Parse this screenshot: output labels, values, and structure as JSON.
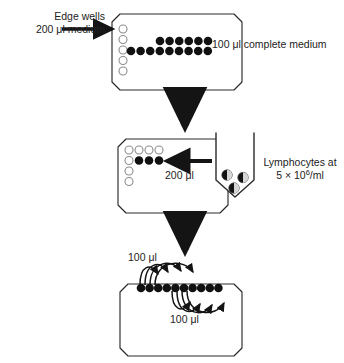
{
  "figure": {
    "background": "#ffffff",
    "ink": "#1a1a1a"
  },
  "labels": {
    "edge_wells_line1": "Edge wells",
    "edge_wells_line2": "200 μl medium",
    "complete_medium": "100 μl complete medium",
    "two_hundred_ul": "200 μl",
    "lymphocytes_line1": "Lymphocytes at",
    "lymphocytes_line2_prefix": "5 × 10",
    "lymphocytes_line2_sup": "6",
    "lymphocytes_line2_suffix": "/ml",
    "hundred_ul_top": "100 μl",
    "hundred_ul_bottom": "100 μl"
  },
  "colors": {
    "outline": "#2a2a2a",
    "filled_well": "#111111",
    "open_well_stroke": "#8d8d8d",
    "open_well_fill": "#ffffff",
    "arrow": "#141414"
  },
  "steps": [
    {
      "id": "step-1",
      "name": "plate-dispense-medium",
      "plate": {
        "x": 112,
        "y": 14,
        "width": 130,
        "height": 76
      },
      "open_wells": {
        "count": 5,
        "start_x": 122,
        "start_y": 29,
        "dy": 10.5,
        "r": 4.0
      },
      "filled_rows": [
        {
          "count": 6,
          "start_x": 158,
          "y": 41,
          "dx": 9.6,
          "r": 4.2
        },
        {
          "count": 11,
          "start_x": 129,
          "y": 51,
          "dx": 9.6,
          "r": 4.2
        }
      ],
      "in_arrow": {
        "x1": 62,
        "y1": 29,
        "x2": 118,
        "y2": 29
      }
    },
    {
      "id": "step-2",
      "name": "plate-add-lymphocytes",
      "plate": {
        "x": 118,
        "y": 139,
        "width": 110,
        "height": 74
      },
      "open_wells_column": {
        "count": 5,
        "start_x": 128,
        "start_y": 150,
        "dy": 10.5,
        "r": 4.0
      },
      "open_wells_row": {
        "count": 3,
        "start_x": 138,
        "y": 150,
        "dx": 10.0,
        "r": 4.0
      },
      "filled_row": {
        "count": 3,
        "start_x": 138,
        "y": 160.5,
        "dx": 10.0,
        "r": 4.2
      },
      "in_arrow": {
        "x1": 212,
        "y1": 161,
        "x2": 160,
        "y2": 161
      },
      "trough": {
        "x": 214,
        "y": 133,
        "width": 42,
        "height": 62
      },
      "cells": [
        {
          "cx": 228,
          "cy": 175,
          "r": 5.2
        },
        {
          "cx": 243,
          "cy": 178,
          "r": 5.2
        },
        {
          "cx": 234,
          "cy": 188,
          "r": 5.2
        }
      ]
    },
    {
      "id": "step-3",
      "name": "plate-serial-dilution",
      "plate": {
        "x": 120,
        "y": 284,
        "width": 122,
        "height": 72
      },
      "filled_row": {
        "count": 10,
        "start_x": 140,
        "y": 288,
        "dx": 8.6,
        "r": 4.2
      }
    }
  ],
  "connectors": [
    {
      "id": "arrow-1-2",
      "name": "down-arrow-step1-step2",
      "x": 185,
      "y1": 98,
      "y2": 132
    },
    {
      "id": "arrow-2-3",
      "name": "down-arrow-step2-step3",
      "x": 185,
      "y1": 222,
      "y2": 256
    }
  ]
}
